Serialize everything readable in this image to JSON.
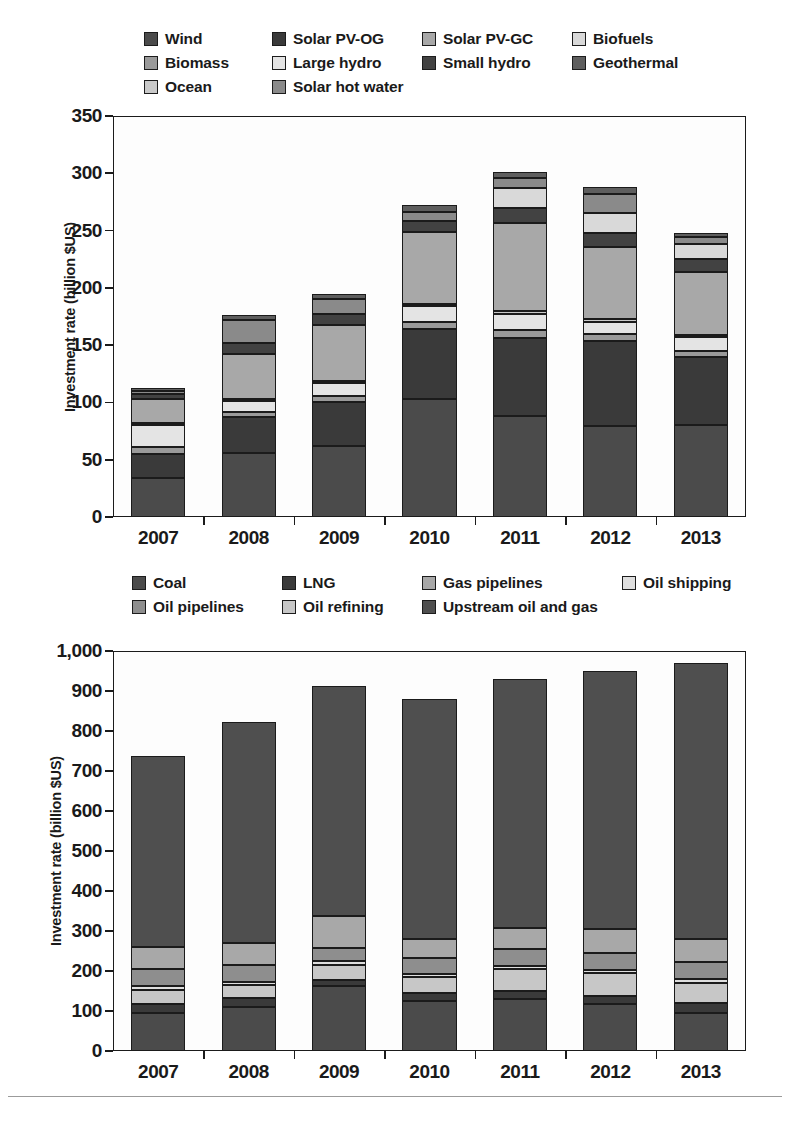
{
  "charts": [
    {
      "id": "renewable-energy-investment",
      "ylabel": "Investment rate (billion $US)",
      "yticks": [
        "0",
        "50",
        "100",
        "150",
        "200",
        "250",
        "300",
        "350"
      ],
      "ylim": [
        0,
        350
      ],
      "categories": [
        "2007",
        "2008",
        "2009",
        "2010",
        "2011",
        "2012",
        "2013"
      ],
      "legend": [
        {
          "label": "Wind",
          "color": "#4b4b4b"
        },
        {
          "label": "Solar PV-OG",
          "color": "#3a3a3a"
        },
        {
          "label": "Solar PV-GC",
          "color": "#a8a8a8"
        },
        {
          "label": "Biofuels",
          "color": "#d9d9d9"
        },
        {
          "label": "Biomass",
          "color": "#9a9a9a"
        },
        {
          "label": "Large hydro",
          "color": "#e4e4e4"
        },
        {
          "label": "Small hydro",
          "color": "#424242"
        },
        {
          "label": "Geothermal",
          "color": "#5e5e5e"
        },
        {
          "label": "Ocean",
          "color": "#c9c9c9"
        },
        {
          "label": "Solar hot water",
          "color": "#8a8a8a"
        }
      ]
    },
    {
      "id": "fossil-fuel-investment",
      "ylabel": "Investment rate (billion $US)",
      "yticks": [
        "0",
        "100",
        "200",
        "300",
        "400",
        "500",
        "600",
        "700",
        "800",
        "900",
        "1,000"
      ],
      "ylim": [
        0,
        1000
      ],
      "categories": [
        "2007",
        "2008",
        "2009",
        "2010",
        "2011",
        "2012",
        "2013"
      ],
      "legend": [
        {
          "label": "Coal",
          "color": "#4b4b4b"
        },
        {
          "label": "LNG",
          "color": "#3a3a3a"
        },
        {
          "label": "Gas pipelines",
          "color": "#a8a8a8"
        },
        {
          "label": "Oil shipping",
          "color": "#dedede"
        },
        {
          "label": "Oil pipelines",
          "color": "#8e8e8e"
        },
        {
          "label": "Oil refining",
          "color": "#c7c7c7"
        },
        {
          "label": "Upstream oil and gas",
          "color": "#4f4f4f"
        }
      ]
    }
  ],
  "chart_data": [
    {
      "type": "bar",
      "stacked": true,
      "title": "Renewable energy investment rate by technology, 2007-2013",
      "xlabel": "",
      "ylabel": "Investment rate (billion $US)",
      "ylim": [
        0,
        350
      ],
      "yticks": [
        0,
        50,
        100,
        150,
        200,
        250,
        300,
        350
      ],
      "grid": false,
      "legend_position": "above-plot",
      "categories": [
        "2007",
        "2008",
        "2009",
        "2010",
        "2011",
        "2012",
        "2013"
      ],
      "series": [
        {
          "name": "Wind",
          "color": "#4b4b4b",
          "values": [
            34,
            56,
            62,
            103,
            88,
            79,
            80
          ]
        },
        {
          "name": "Solar PV-OG",
          "color": "#3a3a3a",
          "values": [
            21,
            31,
            38,
            61,
            68,
            75,
            60
          ]
        },
        {
          "name": "Biomass",
          "color": "#9a9a9a",
          "values": [
            6,
            5,
            6,
            6,
            7,
            6,
            5
          ]
        },
        {
          "name": "Large hydro",
          "color": "#e4e4e4",
          "values": [
            19,
            9,
            11,
            14,
            14,
            10,
            12
          ]
        },
        {
          "name": "Ocean",
          "color": "#c9c9c9",
          "values": [
            2,
            2,
            2,
            2,
            3,
            3,
            2
          ]
        },
        {
          "name": "Solar PV-GC",
          "color": "#a8a8a8",
          "values": [
            21,
            39,
            49,
            63,
            77,
            63,
            55
          ]
        },
        {
          "name": "Small hydro",
          "color": "#424242",
          "values": [
            4,
            10,
            9,
            9,
            13,
            12,
            11
          ]
        },
        {
          "name": "Biofuels",
          "color": "#d9d9d9",
          "values": [
            0,
            0,
            0,
            0,
            17,
            17,
            13
          ]
        },
        {
          "name": "Solar hot water",
          "color": "#8a8a8a",
          "values": [
            3,
            20,
            13,
            8,
            9,
            17,
            6
          ]
        },
        {
          "name": "Geothermal",
          "color": "#5e5e5e",
          "values": [
            3,
            4,
            5,
            6,
            5,
            6,
            4
          ]
        }
      ],
      "totals": [
        113,
        176,
        195,
        272,
        301,
        288,
        248
      ]
    },
    {
      "type": "bar",
      "stacked": true,
      "title": "Fossil fuel investment rate by sector, 2007-2013",
      "xlabel": "",
      "ylabel": "Investment rate (billion $US)",
      "ylim": [
        0,
        1000
      ],
      "yticks": [
        0,
        100,
        200,
        300,
        400,
        500,
        600,
        700,
        800,
        900,
        1000
      ],
      "grid": false,
      "legend_position": "above-plot",
      "categories": [
        "2007",
        "2008",
        "2009",
        "2010",
        "2011",
        "2012",
        "2013"
      ],
      "series": [
        {
          "name": "Coal",
          "color": "#4b4b4b",
          "values": [
            95,
            110,
            162,
            125,
            130,
            117,
            96
          ]
        },
        {
          "name": "LNG",
          "color": "#3a3a3a",
          "values": [
            22,
            22,
            16,
            19,
            21,
            21,
            25
          ]
        },
        {
          "name": "Oil refining",
          "color": "#c7c7c7",
          "values": [
            35,
            33,
            38,
            40,
            53,
            56,
            50
          ]
        },
        {
          "name": "Oil shipping",
          "color": "#dedede",
          "values": [
            10,
            8,
            9,
            9,
            9,
            9,
            10
          ]
        },
        {
          "name": "Oil pipelines",
          "color": "#8e8e8e",
          "values": [
            42,
            42,
            33,
            39,
            41,
            42,
            42
          ]
        },
        {
          "name": "Gas pipelines",
          "color": "#a8a8a8",
          "values": [
            56,
            55,
            80,
            48,
            54,
            60,
            58
          ]
        },
        {
          "name": "Upstream oil and gas",
          "color": "#4f4f4f",
          "values": [
            478,
            552,
            574,
            600,
            622,
            645,
            689
          ]
        }
      ],
      "totals": [
        738,
        822,
        912,
        880,
        930,
        950,
        970
      ]
    }
  ]
}
